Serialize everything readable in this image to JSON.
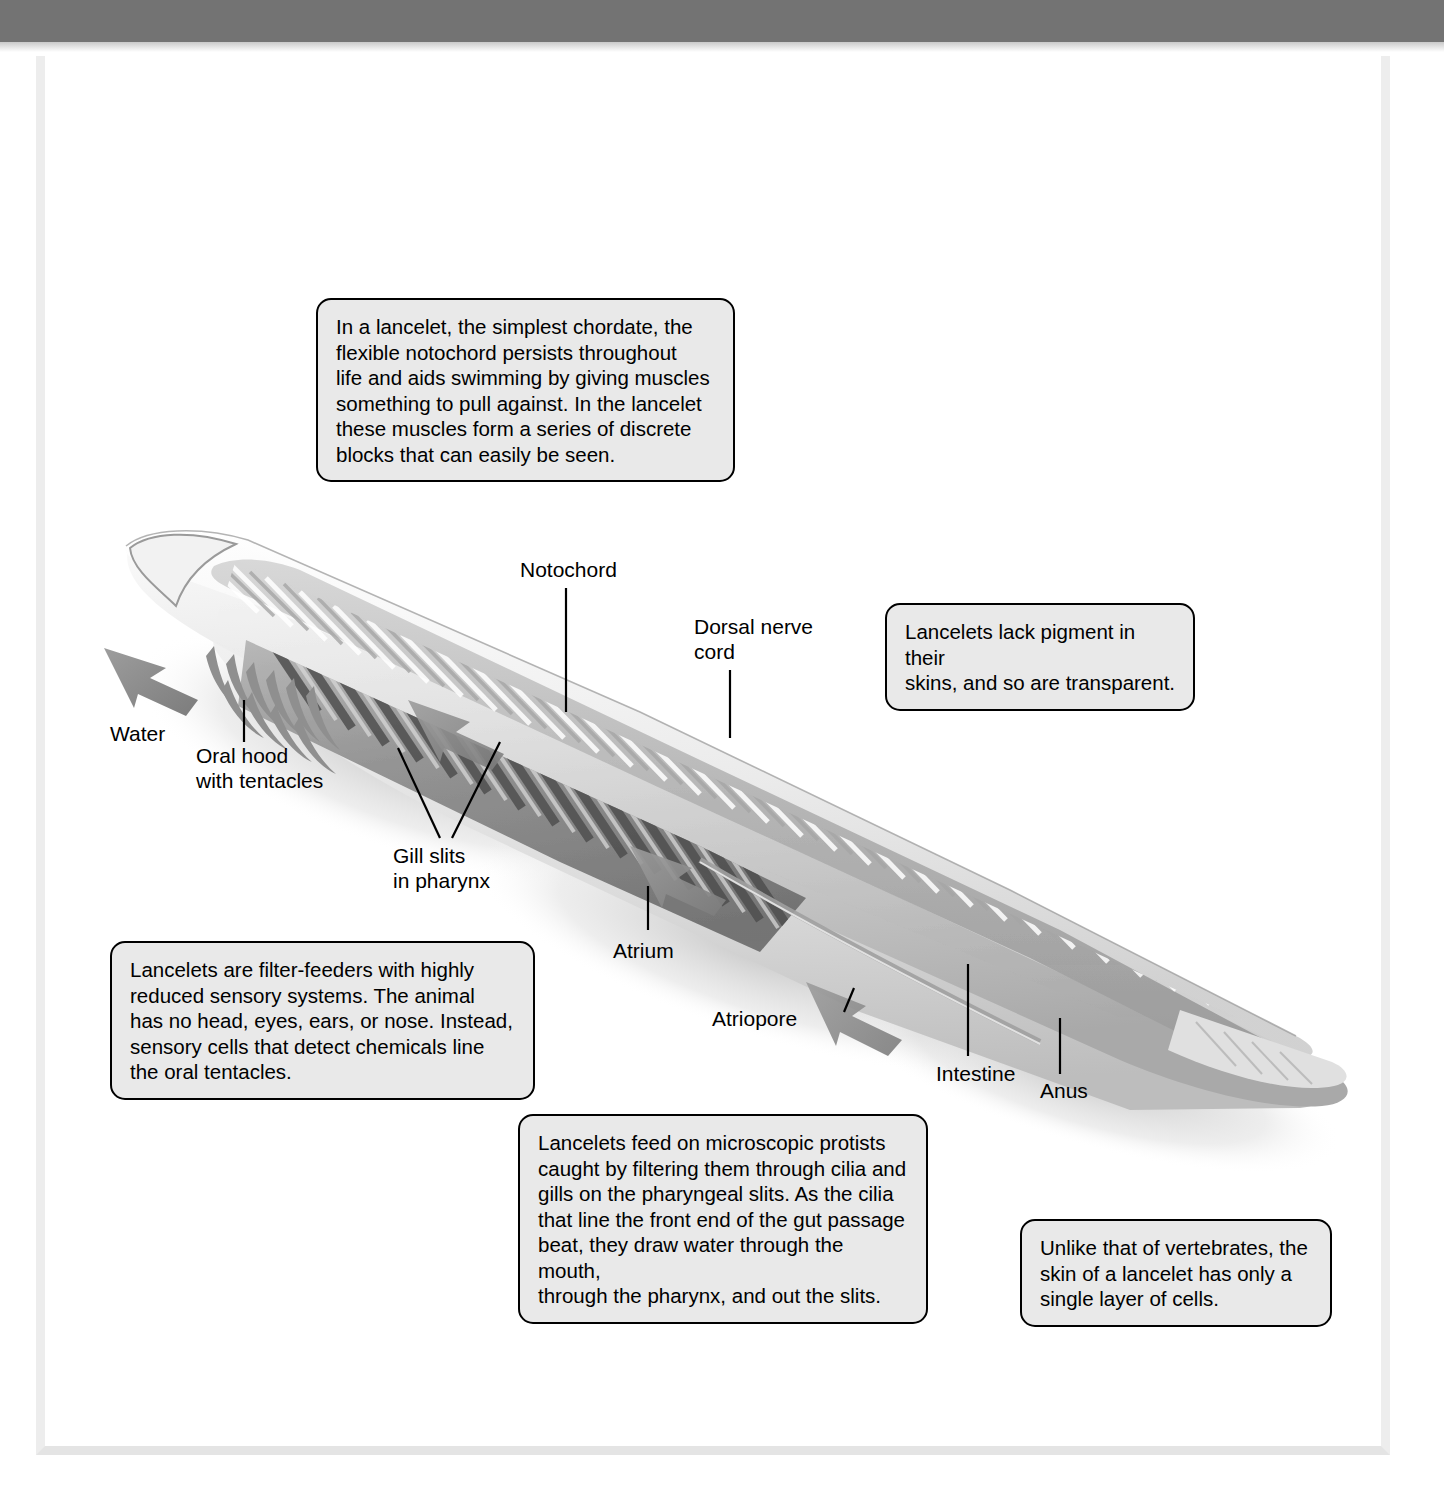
{
  "page": {
    "background_color": "#ffffff",
    "header_bar_color": "#737373",
    "sheet_border_color": "#ededed"
  },
  "figure": {
    "subject": "lancelet",
    "ink_color": "#000000"
  },
  "callouts": [
    {
      "id": "notochord-callout",
      "text": "In a lancelet, the simplest chordate, the\nflexible notochord persists throughout\nlife and aids swimming by giving muscles\nsomething to pull against. In the lancelet\nthese muscles form a series of discrete\nblocks that can easily be seen.",
      "fill": "#e9e9e9",
      "border": "#000000"
    },
    {
      "id": "pigment-callout",
      "text": "Lancelets lack pigment in their\nskins, and so are transparent.",
      "fill": "#e9e9e9",
      "border": "#000000"
    },
    {
      "id": "filter-feeder-callout",
      "text": "Lancelets are filter-feeders with highly\nreduced sensory systems. The animal\nhas no head, eyes, ears, or nose. Instead,\nsensory cells that detect chemicals line\nthe oral tentacles.",
      "fill": "#e9e9e9",
      "border": "#000000"
    },
    {
      "id": "feeding-callout",
      "text": "Lancelets feed on microscopic protists\ncaught by filtering them through cilia and\ngills on the pharyngeal slits. As the cilia\nthat line the front end of the gut passage\nbeat, they draw water through the mouth,\nthrough the pharynx, and out the slits.",
      "fill": "#e9e9e9",
      "border": "#000000"
    },
    {
      "id": "skin-callout",
      "text": "Unlike that of vertebrates, the\nskin of a lancelet has only a\nsingle layer of cells.",
      "fill": "#e9e9e9",
      "border": "#000000"
    }
  ],
  "labels": {
    "notochord": "Notochord",
    "dorsal_nerve_cord": "Dorsal nerve\ncord",
    "water": "Water",
    "oral_hood": "Oral hood\nwith tentacles",
    "gill_slits": "Gill slits\nin pharynx",
    "atrium": "Atrium",
    "atriopore": "Atriopore",
    "intestine": "Intestine",
    "anus": "Anus"
  }
}
